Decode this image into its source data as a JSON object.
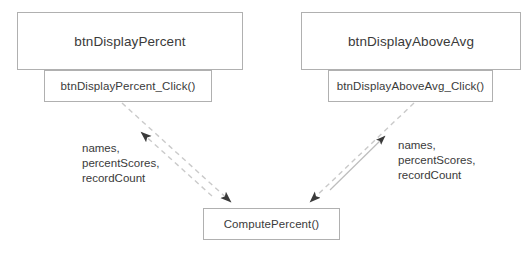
{
  "diagram": {
    "background": "#ffffff",
    "node_border_color": "#b0b0b0",
    "node_fill_color": "#ffffff",
    "text_color": "#3a3a3a",
    "edge_dashed_color": "#c9c9c9",
    "edge_solid_color": "#bdbdbd",
    "arrowhead_color": "#3a3a3a",
    "nodes": {
      "btn_display_percent": "btnDisplayPercent",
      "btn_display_percent_click": "btnDisplayPercent_Click()",
      "btn_display_above_avg": "btnDisplayAboveAvg",
      "btn_display_above_avg_click": "btnDisplayAboveAvg_Click()",
      "compute_percent": "ComputePercent()"
    },
    "edge_labels": {
      "left": "names,\npercentScores,\nrecordCount",
      "right": "names,\npercentScores,\nrecordCount"
    }
  }
}
